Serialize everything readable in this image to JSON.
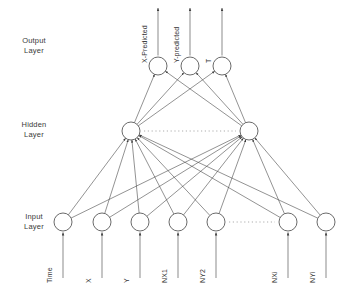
{
  "figure": {
    "background_color": "#ffffff",
    "stroke_color": "#444444",
    "node_fill": "#ffffff"
  },
  "layers": {
    "output": {
      "name_line1": "Output",
      "name_line2": "Layer",
      "y": 66,
      "node_radius": 9,
      "nodes": [
        {
          "id": "out-x",
          "label": "X-Predicted",
          "cx": 158
        },
        {
          "id": "out-y",
          "label": "Y-predicted",
          "cx": 190
        },
        {
          "id": "out-t",
          "label": "T",
          "cx": 222
        }
      ]
    },
    "hidden": {
      "name_line1": "Hidden",
      "name_line2": "Layer",
      "y": 131,
      "node_radius": 9,
      "ellipsis": "· · · · · · · · · · · · · · ·",
      "nodes": [
        {
          "id": "hid-1",
          "cx": 131
        },
        {
          "id": "hid-2",
          "cx": 249
        }
      ]
    },
    "input": {
      "name_line1": "Input",
      "name_line2": "Layer",
      "y": 222,
      "node_radius": 9,
      "ellipsis": "· · · · · · · · · ·",
      "nodes": [
        {
          "id": "in-time",
          "label": "Time",
          "cx": 63
        },
        {
          "id": "in-x",
          "label": "X",
          "cx": 102
        },
        {
          "id": "in-y",
          "label": "Y",
          "cx": 140
        },
        {
          "id": "in-nx1",
          "label": "NX1",
          "cx": 178
        },
        {
          "id": "in-ny2",
          "label": "NY2",
          "cx": 216
        },
        {
          "id": "in-nxi",
          "label": "NXi",
          "cx": 288
        },
        {
          "id": "in-nyi",
          "label": "NYi",
          "cx": 326
        }
      ]
    }
  },
  "chart_data": {
    "type": "diagram",
    "layer_sizes": [
      7,
      2,
      3
    ],
    "input_labels": [
      "Time",
      "X",
      "Y",
      "NX1",
      "NY2",
      "NXi",
      "NYi"
    ],
    "hidden_labels": [
      "",
      ""
    ],
    "output_labels": [
      "X-Predicted",
      "Y-predicted",
      "T"
    ],
    "layer_names": [
      "Input Layer",
      "Hidden Layer",
      "Output Layer"
    ],
    "connections": "fully-connected between adjacent layers",
    "flow_direction": "bottom-to-top"
  }
}
